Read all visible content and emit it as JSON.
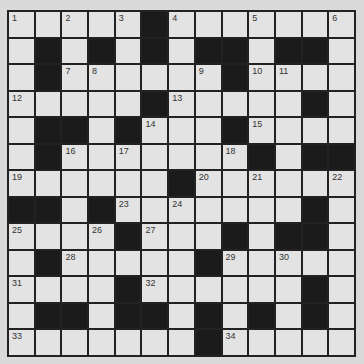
{
  "puzzle": {
    "rows": 13,
    "cols": 13,
    "colors": {
      "background": "#dadada",
      "white_cell": "#e3e3e3",
      "black_cell": "#1b1b1b",
      "grid_line": "#222222",
      "number_text": "#333333"
    },
    "grid": [
      [
        "1",
        "0",
        "2",
        "0",
        "3",
        "B",
        "4",
        "0",
        "0",
        "5",
        "0",
        "0",
        "6"
      ],
      [
        "0",
        "B",
        "0",
        "B",
        "0",
        "B",
        "0",
        "B",
        "B",
        "0",
        "B",
        "B",
        "0"
      ],
      [
        "0",
        "B",
        "7",
        "8",
        "0",
        "0",
        "0",
        "9",
        "B",
        "10",
        "11",
        "0",
        "0"
      ],
      [
        "12",
        "0",
        "0",
        "0",
        "0",
        "B",
        "13",
        "0",
        "0",
        "0",
        "0",
        "B",
        "0"
      ],
      [
        "0",
        "B",
        "B",
        "0",
        "B",
        "14",
        "0",
        "0",
        "B",
        "15",
        "0",
        "0",
        "0"
      ],
      [
        "0",
        "B",
        "16",
        "0",
        "17",
        "0",
        "0",
        "0",
        "18",
        "B",
        "0",
        "B",
        "B"
      ],
      [
        "19",
        "0",
        "0",
        "0",
        "0",
        "0",
        "B",
        "20",
        "0",
        "21",
        "0",
        "0",
        "22"
      ],
      [
        "B",
        "B",
        "0",
        "B",
        "23",
        "0",
        "24",
        "0",
        "0",
        "0",
        "0",
        "B",
        "0"
      ],
      [
        "25",
        "0",
        "0",
        "26",
        "B",
        "27",
        "0",
        "0",
        "B",
        "0",
        "B",
        "B",
        "0"
      ],
      [
        "0",
        "B",
        "28",
        "0",
        "0",
        "0",
        "0",
        "B",
        "29",
        "0",
        "30",
        "0",
        "0"
      ],
      [
        "31",
        "0",
        "0",
        "0",
        "B",
        "32",
        "0",
        "0",
        "0",
        "0",
        "0",
        "B",
        "0"
      ],
      [
        "0",
        "B",
        "B",
        "0",
        "B",
        "B",
        "0",
        "B",
        "0",
        "B",
        "0",
        "B",
        "0"
      ],
      [
        "33",
        "0",
        "0",
        "0",
        "0",
        "0",
        "0",
        "B",
        "34",
        "0",
        "0",
        "0",
        "0"
      ]
    ]
  }
}
